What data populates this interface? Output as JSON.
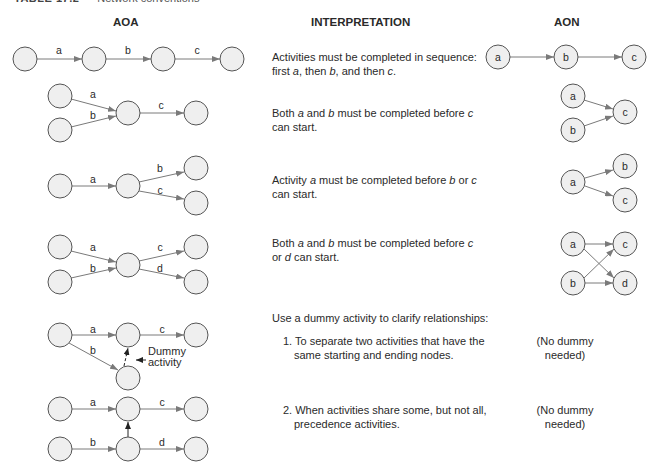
{
  "caption": {
    "table_id": "TABLE 17.2",
    "title": "Network conventions"
  },
  "headers": {
    "aoa": "AOA",
    "interpretation": "INTERPRETATION",
    "aon": "AON"
  },
  "rows": [
    {
      "interp_parts": [
        "Activities must be completed in sequence: first ",
        "a",
        ", then ",
        "b",
        ", and then ",
        "c",
        "."
      ]
    },
    {
      "interp_parts": [
        "Both ",
        "a",
        " and ",
        "b",
        " must be completed before ",
        "c",
        " can start."
      ]
    },
    {
      "interp_parts": [
        "Activity ",
        "a",
        " must be completed before ",
        "b",
        " or ",
        "c",
        " can start."
      ]
    },
    {
      "interp_parts": [
        "Both ",
        "a",
        " and ",
        "b",
        " must be completed before ",
        "c",
        " or ",
        "d",
        " can start."
      ]
    }
  ],
  "dummy_section": {
    "intro": "Use a dummy activity to clarify relationships:",
    "item1": "1. To separate two activities that have the same starting and ending nodes.",
    "item2": "2. When activities share some, but not all, precedence activities.",
    "no_dummy_line1": "(No dummy",
    "no_dummy_line2": "needed)",
    "dummy_label_line1": "Dummy",
    "dummy_label_line2": "activity"
  },
  "labels": {
    "a": "a",
    "b": "b",
    "c": "c",
    "d": "d"
  },
  "colors": {
    "node_fill": "#efefef",
    "node_stroke": "#555555",
    "edge": "#7a7a7a",
    "text": "#2a2a2a"
  }
}
